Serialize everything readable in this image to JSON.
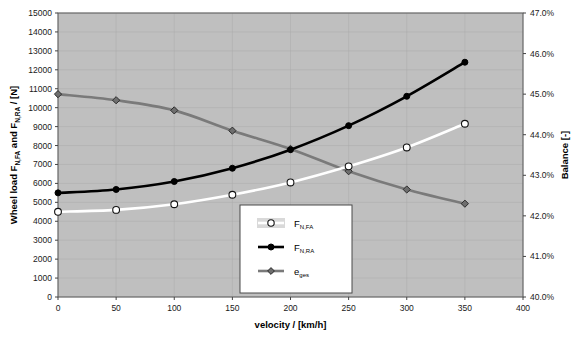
{
  "chart_data": {
    "type": "line",
    "title": "",
    "xlabel": "velocity / [km/h]",
    "ylabel": "Wheel load F",
    "ylabel_parts": {
      "p1": "Wheel load F",
      "sub1": "N,FA",
      "p2": " and F",
      "sub2": "N,RA",
      "p3": " / [N]"
    },
    "y2label": "Balance [-]",
    "x": [
      0,
      50,
      100,
      150,
      200,
      250,
      300,
      350
    ],
    "xlim": [
      0,
      400
    ],
    "xticks": [
      "0",
      "50",
      "100",
      "150",
      "200",
      "250",
      "300",
      "350",
      "400"
    ],
    "xtick_values": [
      0,
      50,
      100,
      150,
      200,
      250,
      300,
      350,
      400
    ],
    "ylim": [
      0,
      15000
    ],
    "yticks": [
      "0",
      "1000",
      "2000",
      "3000",
      "4000",
      "5000",
      "6000",
      "7000",
      "8000",
      "9000",
      "10000",
      "11000",
      "12000",
      "13000",
      "14000",
      "15000"
    ],
    "ytick_values": [
      0,
      1000,
      2000,
      3000,
      4000,
      5000,
      6000,
      7000,
      8000,
      9000,
      10000,
      11000,
      12000,
      13000,
      14000,
      15000
    ],
    "y2lim": [
      40.0,
      47.0
    ],
    "y2ticks": [
      "40.0%",
      "41.0%",
      "42.0%",
      "43.0%",
      "44.0%",
      "45.0%",
      "46.0%",
      "47.0%"
    ],
    "y2tick_values": [
      40.0,
      41.0,
      42.0,
      43.0,
      44.0,
      45.0,
      46.0,
      47.0
    ],
    "grid": true,
    "plot_background": "#bfbfbf",
    "legend_position": "inside-bottom-center",
    "series": [
      {
        "name": "F_N,FA",
        "label_main": "F",
        "label_sub": "N,FA",
        "axis": "left",
        "color": "#ffffff",
        "marker": "circle-open",
        "values": [
          4500,
          4600,
          4900,
          5400,
          6050,
          6900,
          7900,
          9150
        ]
      },
      {
        "name": "F_N,RA",
        "label_main": "F",
        "label_sub": "N,RA",
        "axis": "left",
        "color": "#000000",
        "marker": "circle-filled",
        "values": [
          5500,
          5680,
          6100,
          6800,
          7780,
          9050,
          10600,
          12400
        ]
      },
      {
        "name": "e_ges",
        "label_main": "e",
        "label_sub": "ges",
        "axis": "right",
        "color": "#7a7a7a",
        "marker": "diamond",
        "values": [
          45.0,
          44.85,
          44.6,
          44.1,
          43.65,
          43.1,
          42.65,
          42.3
        ]
      }
    ]
  }
}
